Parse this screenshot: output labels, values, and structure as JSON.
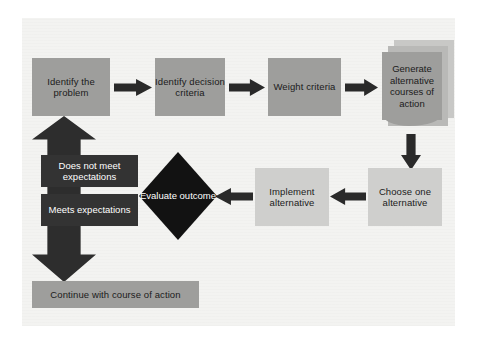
{
  "diagram": {
    "background_color": "#f3f3f1",
    "nodes": {
      "identify_problem": "Identify the problem",
      "identify_criteria": "Identify decision criteria",
      "weight_criteria": "Weight criteria",
      "generate_alternatives": "Generate alternative courses of action",
      "choose_alternative": "Choose one alternative",
      "implement_alternative": "Implement alternative",
      "evaluate_outcome": "Evaluate outcome",
      "continue_action": "Continue with course of action"
    },
    "labels": {
      "does_not_meet": "Does not meet expectations",
      "meets": "Meets expectations"
    },
    "colors": {
      "box_medium": "#9e9e9c",
      "box_light": "#cfcfcd",
      "decision": "#121212",
      "label": "#333333",
      "arrow": "#2a2a2a",
      "text_dark": "#1b1b1b",
      "text_light": "#ffffff"
    }
  }
}
